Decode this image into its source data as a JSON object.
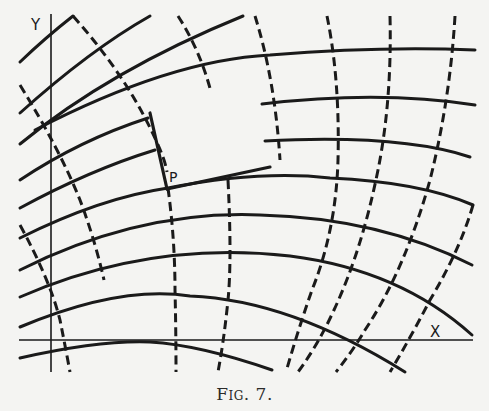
{
  "figure": {
    "caption": "Fig. 7.",
    "labels": {
      "y_axis": "Y",
      "x_axis": "X",
      "point": "P"
    },
    "colors": {
      "ink": "#1a1a1a",
      "paper": "#f4f4f2"
    },
    "families": {
      "solid_curve_count": 12,
      "dashed_curve_count": 11
    }
  }
}
